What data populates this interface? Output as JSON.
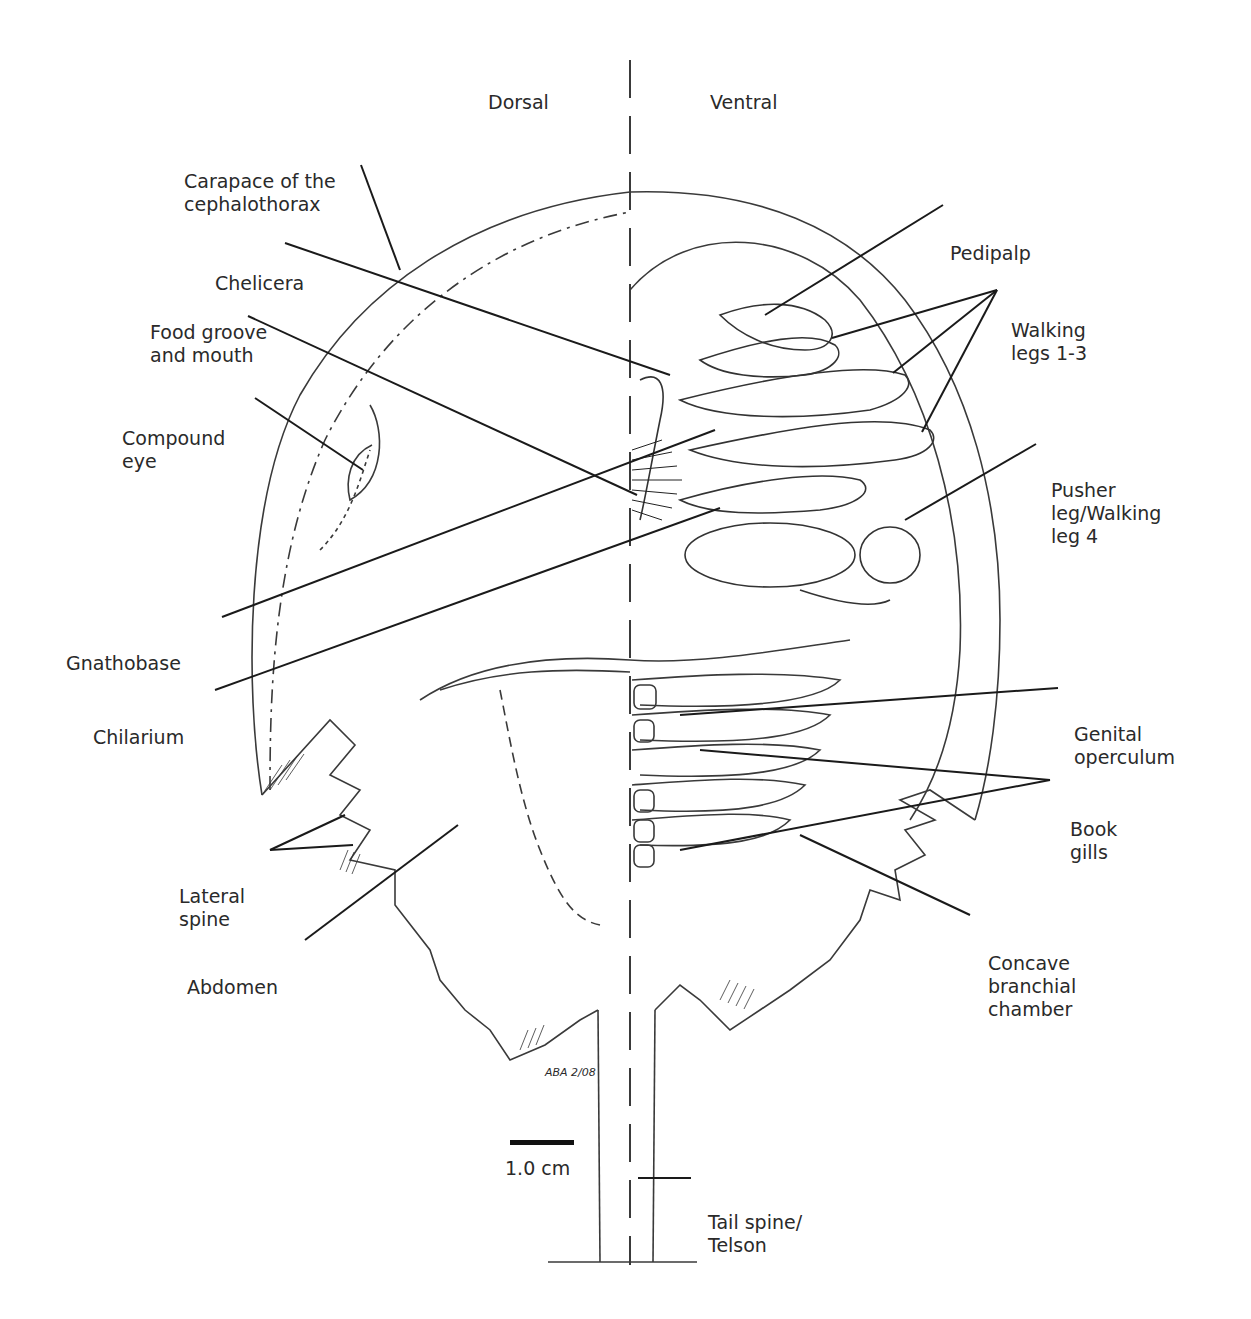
{
  "diagram": {
    "halves": {
      "left": "Dorsal",
      "right": "Ventral"
    },
    "labels": {
      "carapace": [
        "Carapace of the",
        "cephalothorax"
      ],
      "chelicera": [
        "Chelicera"
      ],
      "food_groove": [
        "Food groove",
        "and mouth"
      ],
      "compound_eye": [
        "Compound",
        "eye"
      ],
      "gnathobase": [
        "Gnathobase"
      ],
      "chilarium": [
        "Chilarium"
      ],
      "lateral_spine": [
        "Lateral",
        "spine"
      ],
      "abdomen": [
        "Abdomen"
      ],
      "pedipalp": [
        "Pedipalp"
      ],
      "walking_legs": [
        "Walking",
        "legs 1-3"
      ],
      "pusher_leg": [
        "Pusher",
        "leg/Walking",
        "leg 4"
      ],
      "genital_operculum": [
        "Genital",
        "operculum"
      ],
      "book_gills": [
        "Book",
        "gills"
      ],
      "branchial_chamber": [
        "Concave",
        "branchial",
        "chamber"
      ],
      "telson": [
        "Tail spine/",
        "Telson"
      ]
    },
    "scale_bar": {
      "label": "1.0 cm"
    },
    "signature": "ABA 2/08",
    "colors": {
      "ink": "#2a2a2a",
      "background": "#ffffff"
    }
  }
}
